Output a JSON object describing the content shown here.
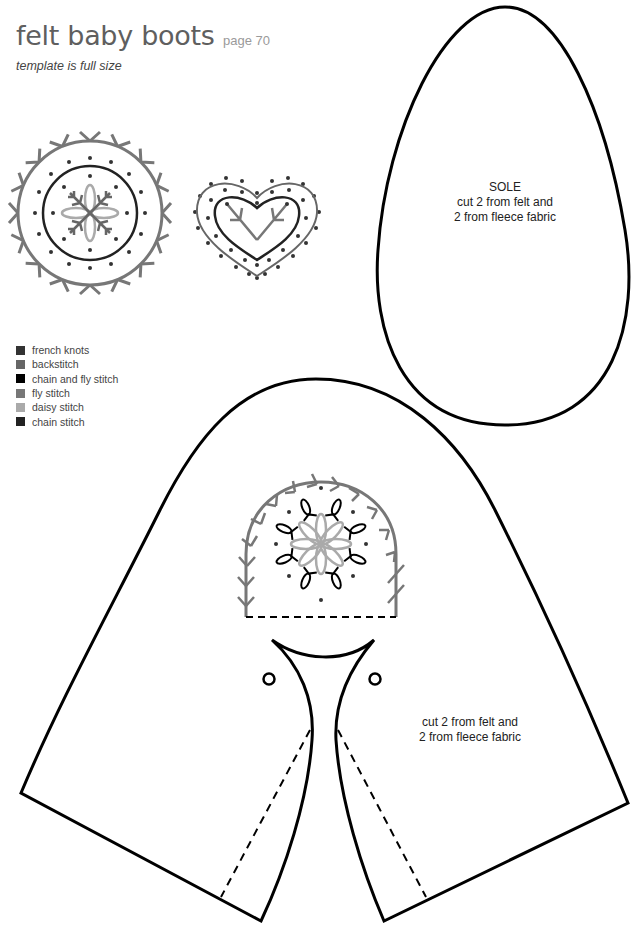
{
  "header": {
    "title": "felt baby boots",
    "page_ref": "page 70",
    "subtitle": "template is full size"
  },
  "legend": {
    "items": [
      {
        "label": "french knots",
        "color": "#333333"
      },
      {
        "label": "backstitch",
        "color": "#666666"
      },
      {
        "label": "chain and fly stitch",
        "color": "#000000"
      },
      {
        "label": "fly stitch",
        "color": "#777777"
      },
      {
        "label": "daisy stitch",
        "color": "#aaaaaa"
      },
      {
        "label": "chain stitch",
        "color": "#222222"
      }
    ]
  },
  "patterns": {
    "sole": {
      "name": "SOLE",
      "line1": "cut 2 from felt and",
      "line2": "2 from fleece fabric"
    },
    "upper": {
      "line1": "cut 2 from felt and",
      "line2": "2 from fleece fabric"
    }
  },
  "motifs": [
    "circle-motif",
    "heart-motif",
    "arch-motif"
  ],
  "colors": {
    "outline": "#000000",
    "fly_stitch": "#777777",
    "daisy_stitch": "#aaaaaa",
    "french_knots": "#333333",
    "backstitch": "#666666",
    "chain_stitch": "#222222"
  }
}
